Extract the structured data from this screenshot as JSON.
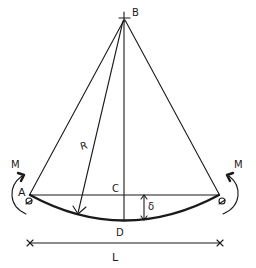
{
  "diagram": {
    "labels": {
      "apex": "B",
      "left_support": "A",
      "chord_mid": "C",
      "arc_mid": "D",
      "radius": "R",
      "deflection": "δ",
      "span": "L",
      "moment_left": "M",
      "moment_right": "M"
    },
    "colors": {
      "ink": "#1a1a1a",
      "background": "#ffffff"
    }
  }
}
